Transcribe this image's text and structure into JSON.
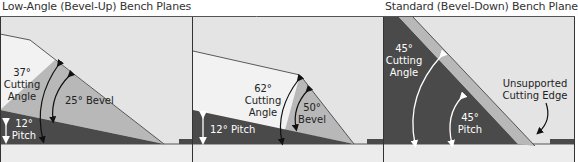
{
  "titles": {
    "left": "Low-Angle (Bevel-Up) Bench Planes",
    "right": "Standard (Bevel-Down) Bench Plane"
  },
  "panels": [
    {
      "name": "low-angle-25-bevel",
      "cutting_angle": "37°",
      "cutting_label_1": "Cutting",
      "cutting_label_2": "Angle",
      "bevel": "25° Bevel",
      "pitch": "12°",
      "pitch_label": "Pitch"
    },
    {
      "name": "low-angle-50-bevel",
      "cutting_angle": "62°",
      "cutting_label_1": "Cutting",
      "cutting_label_2": "Angle",
      "bevel": "50°",
      "bevel_label": "Bevel",
      "pitch": "12° Pitch"
    },
    {
      "name": "standard-bevel-down",
      "cutting_angle": "45°",
      "cutting_label_1": "Cutting",
      "cutting_label_2": "Angle",
      "pitch": "45°",
      "pitch_label": "Pitch",
      "edge_label_1": "Unsupported",
      "edge_label_2": "Cutting Edge"
    }
  ],
  "colors": {
    "panel_bg": "#e4e4e4",
    "body_dark": "#4a4a4a",
    "blade_light": "#f2f2f2",
    "bevel_mid": "#b8b8b8",
    "sole": "#ececec",
    "border": "#333333"
  }
}
